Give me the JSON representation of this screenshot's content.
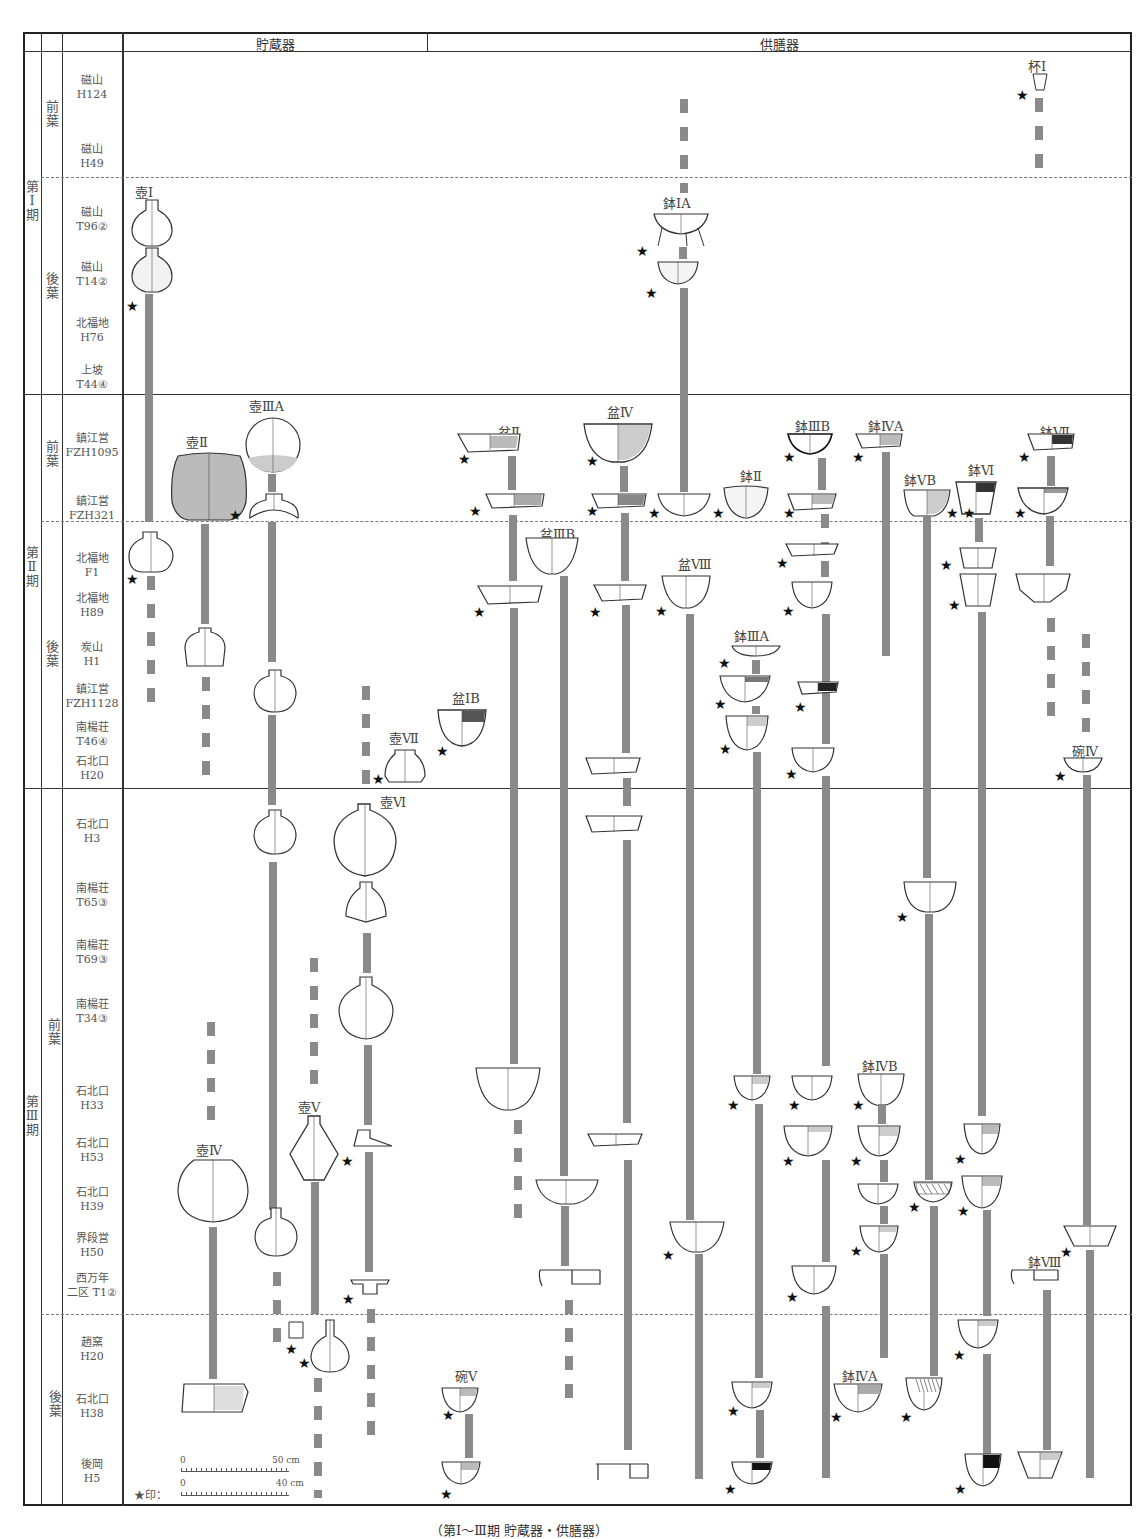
{
  "figure": {
    "headers": {
      "storage": "貯蔵器",
      "serving": "供膳器"
    },
    "legend": {
      "scale_top_zero": "0",
      "scale_top_max": "50 cm",
      "scale_bottom_label": "★印：",
      "scale_bottom_zero": "0",
      "scale_bottom_max": "40 cm"
    },
    "caption": "（第Ⅰ～Ⅲ期 貯蔵器・供膳器）"
  },
  "periods": [
    {
      "label": "第Ⅰ期",
      "sub": [
        {
          "label": "前葉"
        },
        {
          "label": "後葉"
        }
      ]
    },
    {
      "label": "第Ⅱ期",
      "sub": [
        {
          "label": "前葉"
        },
        {
          "label": "後葉"
        }
      ]
    },
    {
      "label": "第Ⅲ期",
      "sub": [
        {
          "label": "前葉"
        },
        {
          "label": "後葉"
        }
      ]
    }
  ],
  "sites": [
    {
      "name": "磁山",
      "unit": "H124"
    },
    {
      "name": "磁山",
      "unit": "H49"
    },
    {
      "name": "磁山",
      "unit": "T96②"
    },
    {
      "name": "磁山",
      "unit": "T14②"
    },
    {
      "name": "北福地",
      "unit": "H76"
    },
    {
      "name": "上坡",
      "unit": "T44④"
    },
    {
      "name": "鎮江営",
      "unit": "FZH1095"
    },
    {
      "name": "鎮江営",
      "unit": "FZH321"
    },
    {
      "name": "北福地",
      "unit": "F1"
    },
    {
      "name": "北福地",
      "unit": "H89"
    },
    {
      "name": "炭山",
      "unit": "H1"
    },
    {
      "name": "鎮江営",
      "unit": "FZH1128"
    },
    {
      "name": "南楊荘",
      "unit": "T46④"
    },
    {
      "name": "石北口",
      "unit": "H20"
    },
    {
      "name": "石北口",
      "unit": "H3"
    },
    {
      "name": "南楊荘",
      "unit": "T65③"
    },
    {
      "name": "南楊荘",
      "unit": "T69③"
    },
    {
      "name": "南楊荘",
      "unit": "T34③"
    },
    {
      "name": "石北口",
      "unit": "H33"
    },
    {
      "name": "石北口",
      "unit": "H53"
    },
    {
      "name": "石北口",
      "unit": "H39"
    },
    {
      "name": "界段営",
      "unit": "H50"
    },
    {
      "name": "西万年",
      "unit": "二区 T1②"
    },
    {
      "name": "趙窯",
      "unit": "H20"
    },
    {
      "name": "石北口",
      "unit": "H38"
    },
    {
      "name": "後岡",
      "unit": "H5"
    }
  ],
  "types": {
    "storage": [
      {
        "label": "壺Ⅰ"
      },
      {
        "label": "壺Ⅱ"
      },
      {
        "label": "壺ⅢA"
      },
      {
        "label": "壺Ⅳ"
      },
      {
        "label": "壺Ⅴ"
      },
      {
        "label": "壺Ⅵ"
      },
      {
        "label": "壺Ⅶ"
      }
    ],
    "serving": [
      {
        "label": "杯Ⅰ"
      },
      {
        "label": "鉢ⅠA"
      },
      {
        "label": "盆Ⅱ"
      },
      {
        "label": "盆Ⅳ"
      },
      {
        "label": "鉢Ⅱ"
      },
      {
        "label": "鉢ⅢB"
      },
      {
        "label": "鉢ⅣA"
      },
      {
        "label": "鉢ⅤB"
      },
      {
        "label": "鉢Ⅵ"
      },
      {
        "label": "鉢Ⅶ"
      },
      {
        "label": "盆ⅢB"
      },
      {
        "label": "盆Ⅷ"
      },
      {
        "label": "鉢ⅢA"
      },
      {
        "label": "盆ⅠB"
      },
      {
        "label": "碗Ⅳ"
      },
      {
        "label": "鉢ⅣB"
      },
      {
        "label": "鉢Ⅷ"
      },
      {
        "label": "鉢ⅣA"
      },
      {
        "label": "碗Ⅴ"
      }
    ]
  },
  "colors": {
    "bar": "#8a8a8a",
    "grid": "#333333",
    "star": "#111111"
  }
}
